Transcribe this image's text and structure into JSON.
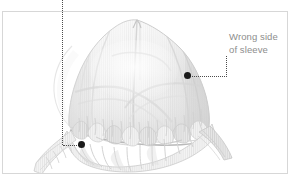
{
  "diagram": {
    "frame": {
      "border_color": "#d7d7d7",
      "background_color": "#ffffff"
    },
    "callouts": [
      {
        "id": "wrong-side-of-sleeve",
        "line1": "Wrong side",
        "line2": "of sleeve",
        "text_color": "#8d8d8d",
        "marker_color": "#1a1a1a",
        "marker_point": "184,72",
        "leader": "horizontal then vertical"
      },
      {
        "id": "gathered-hem-marker",
        "line1": "",
        "line2": "",
        "marker_color": "#1a1a1a",
        "marker_point": "78,141",
        "leader": "vertical from top of page then short horizontal"
      }
    ],
    "artwork": {
      "fabric_fill": "#f2f2f2",
      "fabric_stripe": "#e2e2e2",
      "shade_light": "#e9e9e9",
      "shade_mid": "#dadada",
      "shade_dark": "#c3c3c3",
      "outline": "#cfcfcf"
    }
  }
}
